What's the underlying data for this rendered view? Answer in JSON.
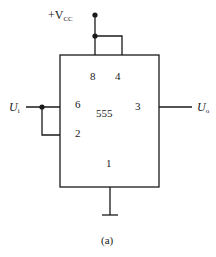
{
  "diagram": {
    "type": "circuit-schematic",
    "caption": "(a)",
    "supply": {
      "label_main": "+V",
      "label_sub": "CC"
    },
    "input": {
      "label_main": "U",
      "label_sub": "i"
    },
    "output": {
      "label_main": "U",
      "label_sub": "o"
    },
    "chip": {
      "name": "555",
      "pins": {
        "p8": "8",
        "p4": "4",
        "p6": "6",
        "p3": "3",
        "p2": "2",
        "p1": "1"
      }
    },
    "colors": {
      "line": "#1a1a1a",
      "background": "#ffffff"
    }
  }
}
